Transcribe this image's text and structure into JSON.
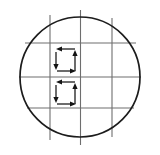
{
  "figure": {
    "caption": "",
    "background_color": "#ffffff"
  },
  "canvas": {
    "width": 160,
    "height": 155
  },
  "colors": {
    "circle_stroke": "#1c1c1c",
    "grid_stroke": "#6e6e6e",
    "arrow_stroke": "#141414",
    "background": "#ffffff"
  },
  "chart_data": {
    "type": "diagram",
    "xlabel": "",
    "ylabel": "",
    "xlim": [
      0,
      160
    ],
    "ylim": [
      0,
      155
    ],
    "grid": true,
    "legend": "none",
    "shapes": [
      {
        "name": "boundary-circle",
        "type": "circle",
        "cx": 80,
        "cy": 77,
        "r": 60,
        "stroke": "#1c1c1c",
        "stroke_width": 1.7,
        "fill": "none"
      }
    ],
    "grid_lines": {
      "vertical": [
        {
          "name": "vertical-grid-left",
          "x": 50,
          "y1": 15,
          "y2": 140
        },
        {
          "name": "vertical-grid-center",
          "x": 80.5,
          "y1": 10,
          "y2": 145
        },
        {
          "name": "vertical-grid-right",
          "x": 112,
          "y1": 18,
          "y2": 137
        }
      ],
      "horizontal": [
        {
          "name": "horizontal-grid-top",
          "y": 43,
          "x1": 25,
          "x2": 136
        },
        {
          "name": "horizontal-grid-middle",
          "y": 77,
          "x1": 19,
          "x2": 141
        },
        {
          "name": "horizontal-grid-bottom",
          "y": 108,
          "x1": 27,
          "x2": 134
        }
      ]
    },
    "loops": [
      {
        "name": "upper-circulation-loop",
        "cell": {
          "x1": 50,
          "y1": 43,
          "x2": 80.5,
          "y2": 77
        },
        "direction": "clockwise-reversed",
        "arrows": [
          {
            "name": "arrow-top-left",
            "from": [
              75,
              49
            ],
            "to": [
              56,
              49
            ],
            "direction": "left"
          },
          {
            "name": "arrow-left-down",
            "from": [
              56,
              52
            ],
            "to": [
              56,
              70
            ],
            "direction": "down"
          },
          {
            "name": "arrow-right-up",
            "from": [
              75,
              71
            ],
            "to": [
              75,
              50
            ],
            "direction": "up"
          },
          {
            "name": "arrow-bottom-right",
            "from": [
              57,
              71
            ],
            "to": [
              76,
              71
            ],
            "direction": "right"
          }
        ]
      },
      {
        "name": "lower-circulation-loop",
        "cell": {
          "x1": 50,
          "y1": 77,
          "x2": 80.5,
          "y2": 108
        },
        "direction": "clockwise-reversed",
        "arrows": [
          {
            "name": "arrow-top-left",
            "from": [
              75,
              82
            ],
            "to": [
              56,
              82
            ],
            "direction": "left"
          },
          {
            "name": "arrow-left-down",
            "from": [
              56,
              85
            ],
            "to": [
              56,
              103
            ],
            "direction": "down"
          },
          {
            "name": "arrow-right-up",
            "from": [
              75,
              104
            ],
            "to": [
              75,
              83
            ],
            "direction": "up"
          },
          {
            "name": "arrow-bottom-right",
            "from": [
              57,
              104
            ],
            "to": [
              76,
              104
            ],
            "direction": "right"
          }
        ]
      }
    ],
    "annotations": [],
    "tick_labels": {
      "x": [],
      "y": []
    }
  }
}
